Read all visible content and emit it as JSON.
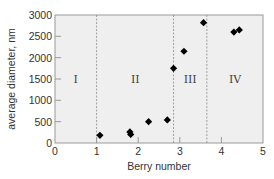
{
  "chart_data": {
    "type": "scatter",
    "title": "",
    "xlabel": "Berry number",
    "ylabel": "average diameter, nm",
    "xlim": [
      0,
      5
    ],
    "ylim": [
      0,
      3000
    ],
    "xticks": [
      0,
      1,
      2,
      3,
      4,
      5
    ],
    "yticks": [
      0,
      500,
      1000,
      1500,
      2000,
      2500,
      3000
    ],
    "grid": false,
    "legend": null,
    "marker": "diamond",
    "series": [
      {
        "name": "berries",
        "points": [
          {
            "x": 1.08,
            "y": 180
          },
          {
            "x": 1.8,
            "y": 260
          },
          {
            "x": 1.82,
            "y": 200
          },
          {
            "x": 2.25,
            "y": 500
          },
          {
            "x": 2.7,
            "y": 540
          },
          {
            "x": 2.85,
            "y": 1750
          },
          {
            "x": 3.1,
            "y": 2150
          },
          {
            "x": 3.57,
            "y": 2820
          },
          {
            "x": 4.3,
            "y": 2600
          },
          {
            "x": 4.43,
            "y": 2650
          }
        ]
      }
    ],
    "region_dividers": [
      1.0,
      2.85,
      3.65
    ],
    "regions": [
      {
        "label": "I",
        "x": 0.5
      },
      {
        "label": "II",
        "x": 1.93
      },
      {
        "label": "III",
        "x": 3.25
      },
      {
        "label": "IV",
        "x": 4.33
      }
    ],
    "region_label_y": 1500
  },
  "colors": {
    "plot_bg": "#efefef",
    "frame": "#9a9a9a",
    "marker": "#000000",
    "divider": "#8a8a8a",
    "text": "#333333"
  }
}
